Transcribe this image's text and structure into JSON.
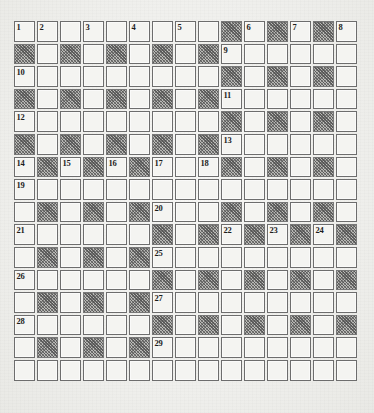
{
  "page": {
    "kind": "crossword-grid",
    "paper_color": "#efefec",
    "white_cell_color": "#f4f4f1",
    "black_cell_color": "#b9b9b6",
    "grid_line_color": "#6d6d6d",
    "number_color": "#1d1d1d"
  },
  "grid": {
    "columns": 15,
    "rows": 16,
    "cell_size_px": 23,
    "legend": {
      "white": ".",
      "black": "#"
    },
    "pattern": [
      ".........#.#.#.",
      "#.#.#.#.#......",
      ".........#.#.#.",
      "#.#.#.#.#......",
      ".........#.#.#.",
      "#.#.#.#.#......",
      ".#.#.#...#.#.#.",
      "...............",
      ".#.#.#...#.#.#.",
      "......#.#.#.#.#",
      ".#.#.#.........",
      "......#.#.#.#.#",
      ".#.#.#.........",
      "......#.#.#.#.#",
      ".#.#.#.........",
      "..............."
    ],
    "numbers": [
      {
        "row": 0,
        "col": 0,
        "n": "1"
      },
      {
        "row": 0,
        "col": 1,
        "n": "2"
      },
      {
        "row": 0,
        "col": 3,
        "n": "3"
      },
      {
        "row": 0,
        "col": 5,
        "n": "4"
      },
      {
        "row": 0,
        "col": 7,
        "n": "5"
      },
      {
        "row": 0,
        "col": 10,
        "n": "6"
      },
      {
        "row": 0,
        "col": 12,
        "n": "7"
      },
      {
        "row": 0,
        "col": 14,
        "n": "8"
      },
      {
        "row": 1,
        "col": 9,
        "n": "9"
      },
      {
        "row": 2,
        "col": 0,
        "n": "10"
      },
      {
        "row": 3,
        "col": 9,
        "n": "11"
      },
      {
        "row": 4,
        "col": 0,
        "n": "12"
      },
      {
        "row": 5,
        "col": 9,
        "n": "13"
      },
      {
        "row": 6,
        "col": 0,
        "n": "14"
      },
      {
        "row": 6,
        "col": 2,
        "n": "15"
      },
      {
        "row": 6,
        "col": 4,
        "n": "16"
      },
      {
        "row": 6,
        "col": 6,
        "n": "17"
      },
      {
        "row": 6,
        "col": 8,
        "n": "18"
      },
      {
        "row": 7,
        "col": 0,
        "n": "19"
      },
      {
        "row": 8,
        "col": 6,
        "n": "20"
      },
      {
        "row": 9,
        "col": 0,
        "n": "21"
      },
      {
        "row": 9,
        "col": 9,
        "n": "22"
      },
      {
        "row": 9,
        "col": 11,
        "n": "23"
      },
      {
        "row": 9,
        "col": 13,
        "n": "24"
      },
      {
        "row": 10,
        "col": 6,
        "n": "25"
      },
      {
        "row": 11,
        "col": 0,
        "n": "26"
      },
      {
        "row": 12,
        "col": 6,
        "n": "27"
      },
      {
        "row": 13,
        "col": 0,
        "n": "28"
      },
      {
        "row": 14,
        "col": 6,
        "n": "29"
      }
    ]
  }
}
